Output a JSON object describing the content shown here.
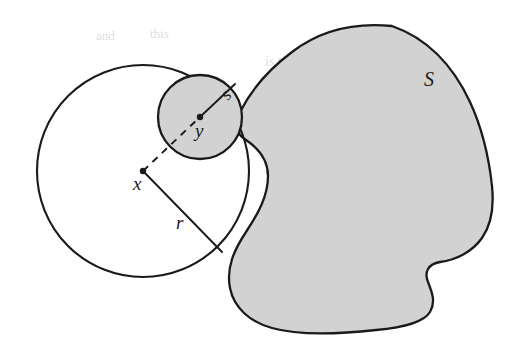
{
  "figure": {
    "background_color": "#ffffff",
    "ink_color": "#1a1a1a",
    "fill_gray": "#d2d2d2",
    "fill_gray_dark": "#c9c9c9",
    "labels": {
      "large_circle_center": "x",
      "large_circle_radius": "r",
      "small_circle_center": "y",
      "small_circle_radius": "s",
      "region": "S"
    },
    "elements": {
      "large_circle": {
        "name": "large-circle",
        "cx": 143,
        "cy": 171,
        "r": 106,
        "fill": "none",
        "stroke": "#1a1a1a",
        "stroke_width": 2.1
      },
      "small_circle": {
        "name": "small-circle",
        "cx": 200,
        "cy": 117,
        "r": 42,
        "fill": "#d2d2d2",
        "stroke": "#1a1a1a",
        "stroke_width": 2.3
      },
      "radius_line_r": {
        "name": "radius-segment-r",
        "x1": 143,
        "y1": 171,
        "x2": 222,
        "y2": 252,
        "stroke_width": 1.9
      },
      "radius_line_s": {
        "name": "radius-segment-s",
        "x1": 200,
        "y1": 117,
        "x2": 235,
        "y2": 84,
        "stroke_width": 1.9
      },
      "dashed_line_xy": {
        "name": "dashed-segment-x-to-y",
        "x1": 143,
        "y1": 171,
        "x2": 200,
        "y2": 117,
        "dash": "7 6",
        "stroke_width": 1.9
      },
      "center_dot_x": {
        "name": "center-dot-x",
        "cx": 143,
        "cy": 171,
        "r": 3.2
      },
      "center_dot_y": {
        "name": "center-dot-y",
        "cx": 200,
        "cy": 117,
        "r": 3.2
      },
      "region_blob": {
        "name": "region-blob-S",
        "fill": "#d2d2d2",
        "stroke": "#1a1a1a",
        "stroke_width": 2.3
      }
    },
    "label_positions": {
      "x": {
        "tx": 133,
        "ty": 190,
        "size": 19
      },
      "r": {
        "tx": 176,
        "ty": 229,
        "size": 19
      },
      "y": {
        "tx": 195,
        "ty": 137,
        "size": 19
      },
      "s": {
        "tx": 228,
        "ty": 101,
        "size": 18
      },
      "S": {
        "tx": 424,
        "ty": 86,
        "size": 20
      }
    },
    "bleed_through_text": [
      {
        "text": "and",
        "x": 388,
        "y": 42,
        "size": 16,
        "rotate": -2
      },
      {
        "text": "pure",
        "x": 420,
        "y": 68,
        "size": 15,
        "rotate": -1
      },
      {
        "text": "is to",
        "x": 265,
        "y": 66,
        "size": 14,
        "rotate": 0
      },
      {
        "text": "of the",
        "x": 322,
        "y": 62,
        "size": 14,
        "rotate": 0
      },
      {
        "text": "that",
        "x": 330,
        "y": 96,
        "size": 13,
        "rotate": 0
      },
      {
        "text": "more",
        "x": 395,
        "y": 100,
        "size": 13,
        "rotate": 0
      },
      {
        "text": "we can",
        "x": 300,
        "y": 196,
        "size": 15,
        "rotate": 0
      },
      {
        "text": "the",
        "x": 382,
        "y": 192,
        "size": 15,
        "rotate": 0
      },
      {
        "text": "the sample",
        "x": 284,
        "y": 226,
        "size": 16,
        "rotate": 0
      },
      {
        "text": "E of the",
        "x": 388,
        "y": 222,
        "size": 16,
        "rotate": 0
      },
      {
        "text": "in the",
        "x": 250,
        "y": 256,
        "size": 15,
        "rotate": 0
      },
      {
        "text": "values",
        "x": 325,
        "y": 254,
        "size": 15,
        "rotate": 0
      },
      {
        "text": "and",
        "x": 96,
        "y": 40,
        "size": 13,
        "rotate": 0
      },
      {
        "text": "this",
        "x": 150,
        "y": 38,
        "size": 13,
        "rotate": 0
      }
    ]
  }
}
